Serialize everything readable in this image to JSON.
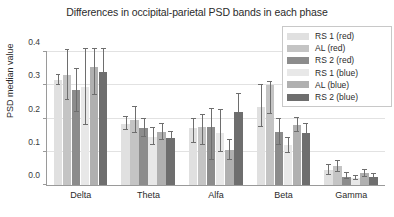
{
  "chart_data": {
    "type": "bar",
    "title": "Differences in occipital-parietal PSD bands in each phase",
    "xlabel": "",
    "ylabel": "PSD median value",
    "ylim": [
      0.0,
      0.4
    ],
    "yticks": [
      "0.0",
      "0.1",
      "0.2",
      "0.3",
      "0.4"
    ],
    "ytick_values": [
      0.0,
      0.1,
      0.2,
      0.3,
      0.4
    ],
    "grid": true,
    "legend_position": "upper right",
    "categories": [
      "Delta",
      "Theta",
      "Alfa",
      "Beta",
      "Gamma"
    ],
    "series": [
      {
        "name": "RS 1 (red)",
        "color": "#e0e0e0",
        "values": [
          0.315,
          0.185,
          0.17,
          0.235,
          0.045
        ],
        "err_low": [
          0.015,
          0.02,
          0.045,
          0.06,
          0.015
        ],
        "err_high": [
          0.015,
          0.02,
          0.03,
          0.065,
          0.015
        ]
      },
      {
        "name": "AL (red)",
        "color": "#c4c4c4",
        "values": [
          0.33,
          0.195,
          0.175,
          0.3,
          0.057
        ],
        "err_low": [
          0.075,
          0.04,
          0.055,
          0.085,
          0.018
        ],
        "err_high": [
          0.075,
          0.04,
          0.035,
          0.01,
          0.015
        ]
      },
      {
        "name": "RS 2 (red)",
        "color": "#8c8c8c",
        "values": [
          0.285,
          0.17,
          0.175,
          0.16,
          0.025
        ],
        "err_low": [
          0.065,
          0.025,
          0.1,
          0.04,
          0.008
        ],
        "err_high": [
          0.065,
          0.03,
          0.055,
          0.038,
          0.01
        ]
      },
      {
        "name": "RS 1 (blue)",
        "color": "#e8e8e8",
        "values": [
          0.295,
          0.145,
          0.155,
          0.12,
          0.02
        ],
        "err_low": [
          0.115,
          0.025,
          0.055,
          0.025,
          0.006
        ],
        "err_high": [
          0.115,
          0.025,
          0.07,
          0.022,
          0.007
        ]
      },
      {
        "name": "AL (blue)",
        "color": "#b0b0b0",
        "values": [
          0.355,
          0.16,
          0.105,
          0.18,
          0.035
        ],
        "err_low": [
          0.085,
          0.025,
          0.03,
          0.02,
          0.01
        ],
        "err_high": [
          0.055,
          0.025,
          0.03,
          0.022,
          0.01
        ]
      },
      {
        "name": "RS 2 (blue)",
        "color": "#6e6e6e",
        "values": [
          0.34,
          0.14,
          0.22,
          0.155,
          0.025
        ],
        "err_low": [
          0.125,
          0.02,
          0.055,
          0.03,
          0.008
        ],
        "err_high": [
          0.07,
          0.02,
          0.055,
          0.03,
          0.008
        ]
      }
    ]
  }
}
